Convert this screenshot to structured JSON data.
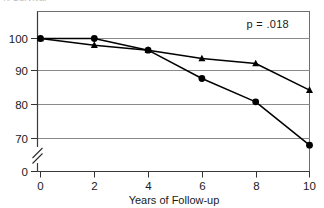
{
  "figure": {
    "clipped_title_fragment": "% Survival",
    "background_color": "#ffffff",
    "frame_color": "#6e6e6e",
    "gridline_color": "#8a8a8a",
    "series_color": "#000000"
  },
  "annotation": {
    "pvalue_label": "p = .018"
  },
  "axes": {
    "x_title": "Years of Follow-up",
    "y_title": "",
    "x_tick_labels": [
      "0",
      "2",
      "4",
      "6",
      "8",
      "10"
    ],
    "y_tick_labels": [
      "100",
      "90",
      "80",
      "70",
      "0"
    ],
    "y_axis_break": true
  },
  "chart_data": {
    "type": "line",
    "title": "% Survival",
    "xlabel": "Years of Follow-up",
    "ylabel": "",
    "x": [
      0,
      2,
      4,
      6,
      8,
      10
    ],
    "xlim": [
      0,
      10
    ],
    "ylim": [
      0,
      104
    ],
    "y_ticks": [
      0,
      70,
      80,
      90,
      100
    ],
    "x_ticks": [
      0,
      2,
      4,
      6,
      8,
      10
    ],
    "grid": true,
    "y_axis_break_between": [
      0,
      70
    ],
    "legend": "none",
    "annotations": [
      {
        "text": "p = .018",
        "x": 8.3,
        "y": 102
      }
    ],
    "series": [
      {
        "name": "triangle-series",
        "marker": "triangle",
        "values": [
          100,
          98,
          96.5,
          94,
          92.5,
          84.5
        ]
      },
      {
        "name": "circle-series",
        "marker": "circle",
        "values": [
          100,
          100,
          96.5,
          88,
          81,
          68
        ]
      }
    ]
  }
}
